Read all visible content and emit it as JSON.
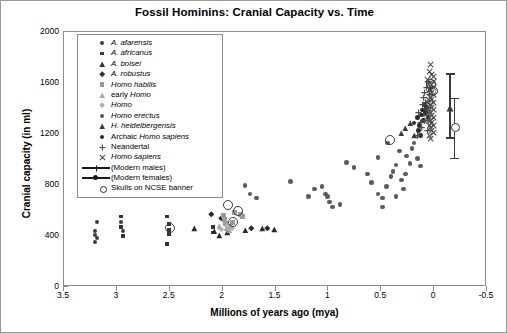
{
  "chart_data": {
    "type": "scatter",
    "title": "Fossil Hominins: Cranial Capacity vs. Time",
    "xlabel": "Millions of years ago (mya)",
    "ylabel": "Cranial capacity (in ml)",
    "xlim": [
      3.5,
      -0.5
    ],
    "ylim": [
      0,
      2000
    ],
    "x_reversed": true,
    "grid": false,
    "legend_position": "upper-left-inside",
    "xticks": [
      "3.5",
      "3",
      "2.5",
      "2",
      "1.5",
      "1",
      "0.5",
      "0",
      "-0.5"
    ],
    "xtick_values": [
      3.5,
      3,
      2.5,
      2,
      1.5,
      1,
      0.5,
      0,
      -0.5
    ],
    "yticks": [
      "0",
      "400",
      "800",
      "1200",
      "1600",
      "2000"
    ],
    "ytick_values": [
      0,
      400,
      800,
      1200,
      1600,
      2000
    ],
    "legend": [
      {
        "label": "A. afarensis",
        "italic": true,
        "marker": "circle",
        "color": "#3d3d3d",
        "size": 4
      },
      {
        "label": "A. africanus",
        "italic": true,
        "marker": "square",
        "color": "#3d3d3d",
        "size": 3.6
      },
      {
        "label": "A. boisei",
        "italic": true,
        "marker": "triangle",
        "color": "#2f2f2f",
        "size": 4.4
      },
      {
        "label": "A. robustus",
        "italic": true,
        "marker": "diamond",
        "color": "#2f2f2f",
        "size": 4.4
      },
      {
        "label": "Homo habilis",
        "italic": true,
        "marker": "square",
        "color": "#9a9a9a",
        "size": 4.6
      },
      {
        "label": "early Homo",
        "italic": false,
        "italic_part": "Homo",
        "marker": "triangle",
        "color": "#a8a8a8",
        "size": 4.4
      },
      {
        "label": "Homo",
        "italic": true,
        "marker": "diamond",
        "color": "#b0b0b0",
        "size": 4.2
      },
      {
        "label": "Homo erectus",
        "italic": true,
        "marker": "circle",
        "color": "#565656",
        "size": 4.4
      },
      {
        "label": "H. heidelbergensis",
        "italic": true,
        "marker": "triangle",
        "color": "#3a3a3a",
        "size": 4.4
      },
      {
        "label": "Archaic Homo sapiens",
        "italic": false,
        "italic_part": "Homo sapiens",
        "marker": "circle",
        "color": "#2b2b2b",
        "size": 4.4
      },
      {
        "label": "Neandertal",
        "italic": false,
        "marker": "plus",
        "color": "#4a4a4a",
        "size": 5
      },
      {
        "label": "Homo sapiens",
        "italic": true,
        "marker": "cross",
        "color": "#4a4a4a",
        "size": 5
      },
      {
        "label": "(Modern males)",
        "italic": false,
        "marker": "line-plus",
        "color": "#1a1a1a",
        "size": 5
      },
      {
        "label": "(Modern females)",
        "italic": false,
        "marker": "line-circle",
        "color": "#1a1a1a",
        "size": 5
      },
      {
        "label": "Skulls on NCSE banner",
        "italic": false,
        "marker": "open-circle",
        "color": "#2b2b2b",
        "size": 5
      }
    ],
    "series": [
      {
        "name": "A. afarensis",
        "marker": "circle",
        "color": "#3d3d3d",
        "size": 4.4,
        "points": [
          [
            3.18,
            500
          ],
          [
            3.2,
            430
          ],
          [
            3.2,
            400
          ],
          [
            3.18,
            375
          ],
          [
            3.2,
            345
          ],
          [
            2.95,
            500
          ],
          [
            2.93,
            430
          ]
        ]
      },
      {
        "name": "A. africanus",
        "marker": "square",
        "color": "#333333",
        "size": 3.8,
        "points": [
          [
            2.95,
            545
          ],
          [
            2.95,
            460
          ],
          [
            2.93,
            395
          ],
          [
            2.52,
            545
          ],
          [
            2.5,
            485
          ],
          [
            2.5,
            440
          ],
          [
            2.5,
            405
          ],
          [
            2.52,
            330
          ],
          [
            2.08,
            460
          ],
          [
            2.08,
            420
          ]
        ]
      },
      {
        "name": "A. boisei",
        "marker": "triangle",
        "color": "#2a2a2a",
        "size": 4.6,
        "points": [
          [
            2.26,
            450
          ],
          [
            2.07,
            430
          ],
          [
            2.02,
            395
          ],
          [
            1.78,
            440
          ],
          [
            1.62,
            450
          ],
          [
            1.5,
            445
          ],
          [
            1.95,
            420
          ]
        ]
      },
      {
        "name": "A. robustus",
        "marker": "diamond",
        "color": "#2a2a2a",
        "size": 4.6,
        "points": [
          [
            2.1,
            560
          ],
          [
            2.0,
            530
          ],
          [
            1.72,
            455
          ],
          [
            1.57,
            455
          ]
        ]
      },
      {
        "name": "Homo habilis",
        "marker": "square",
        "color": "#9c9c9c",
        "size": 5,
        "points": [
          [
            1.98,
            555
          ],
          [
            1.97,
            520
          ],
          [
            1.96,
            490
          ],
          [
            1.93,
            470
          ],
          [
            1.88,
            575
          ],
          [
            1.82,
            560
          ],
          [
            1.8,
            545
          ],
          [
            1.9,
            500
          ]
        ]
      },
      {
        "name": "early Homo",
        "marker": "triangle",
        "color": "#a5a5a5",
        "size": 4.6,
        "points": [
          [
            2.02,
            470
          ],
          [
            1.96,
            455
          ],
          [
            1.93,
            440
          ]
        ]
      },
      {
        "name": "Homo",
        "marker": "diamond",
        "color": "#b2b2b2",
        "size": 4.4,
        "points": [
          [
            1.95,
            470
          ],
          [
            1.9,
            455
          ],
          [
            2.0,
            445
          ]
        ]
      },
      {
        "name": "Homo erectus",
        "marker": "circle",
        "color": "#5a5a5a",
        "size": 4.6,
        "points": [
          [
            1.78,
            790
          ],
          [
            1.73,
            720
          ],
          [
            1.67,
            690
          ],
          [
            1.35,
            820
          ],
          [
            1.18,
            700
          ],
          [
            1.12,
            760
          ],
          [
            1.05,
            780
          ],
          [
            1.02,
            720
          ],
          [
            1.0,
            700
          ],
          [
            0.98,
            660
          ],
          [
            0.95,
            620
          ],
          [
            0.88,
            640
          ],
          [
            0.82,
            970
          ],
          [
            0.75,
            930
          ],
          [
            0.62,
            880
          ],
          [
            0.58,
            810
          ],
          [
            0.52,
            720
          ],
          [
            0.48,
            690
          ],
          [
            0.44,
            780
          ],
          [
            0.4,
            860
          ],
          [
            0.38,
            900
          ],
          [
            0.35,
            950
          ],
          [
            0.3,
            830
          ],
          [
            0.28,
            760
          ],
          [
            0.25,
            1020
          ],
          [
            0.22,
            960
          ],
          [
            0.2,
            1080
          ],
          [
            0.18,
            1120
          ],
          [
            0.15,
            1000
          ],
          [
            0.12,
            940
          ],
          [
            0.32,
            1060
          ],
          [
            0.26,
            880
          ],
          [
            0.35,
            700
          ],
          [
            0.48,
            620
          ],
          [
            0.52,
            1010
          ],
          [
            0.43,
            1120
          ]
        ]
      },
      {
        "name": "H. heidelbergensis",
        "marker": "triangle",
        "color": "#3a3a3a",
        "size": 4.6,
        "points": [
          [
            0.3,
            1200
          ],
          [
            0.26,
            1240
          ],
          [
            0.22,
            1280
          ],
          [
            0.18,
            1180
          ]
        ]
      },
      {
        "name": "Archaic Homo sapiens",
        "marker": "circle",
        "color": "#2b2b2b",
        "size": 4.6,
        "points": [
          [
            0.18,
            1280
          ],
          [
            0.15,
            1320
          ],
          [
            0.13,
            1260
          ],
          [
            0.11,
            1340
          ],
          [
            0.1,
            1380
          ],
          [
            0.09,
            1300
          ],
          [
            0.08,
            1420
          ],
          [
            0.07,
            1360
          ],
          [
            0.12,
            1180
          ],
          [
            0.14,
            1220
          ],
          [
            0.06,
            1400
          ],
          [
            0.05,
            1320
          ]
        ]
      },
      {
        "name": "Neandertal",
        "marker": "plus",
        "color": "#4a4a4a",
        "size": 5.2,
        "points": [
          [
            0.14,
            1360
          ],
          [
            0.1,
            1420
          ],
          [
            0.09,
            1480
          ],
          [
            0.08,
            1520
          ],
          [
            0.07,
            1440
          ],
          [
            0.06,
            1560
          ],
          [
            0.05,
            1400
          ],
          [
            0.12,
            1280
          ],
          [
            0.15,
            1180
          ],
          [
            0.11,
            1240
          ],
          [
            0.04,
            1600
          ],
          [
            0.06,
            1340
          ],
          [
            0.03,
            1500
          ],
          [
            0.05,
            1220
          ],
          [
            0.08,
            1300
          ]
        ]
      },
      {
        "name": "Homo sapiens",
        "marker": "cross",
        "color": "#4a4a4a",
        "size": 5.2,
        "points": [
          [
            0.02,
            1740
          ],
          [
            0.01,
            1660
          ],
          [
            0.0,
            1640
          ],
          [
            0.0,
            1600
          ],
          [
            0.01,
            1580
          ],
          [
            0.0,
            1560
          ],
          [
            0.02,
            1540
          ],
          [
            0.01,
            1520
          ],
          [
            0.0,
            1500
          ],
          [
            0.02,
            1480
          ],
          [
            0.01,
            1460
          ],
          [
            0.0,
            1440
          ],
          [
            0.02,
            1420
          ],
          [
            0.01,
            1400
          ],
          [
            0.0,
            1380
          ],
          [
            0.02,
            1360
          ],
          [
            0.01,
            1340
          ],
          [
            0.0,
            1320
          ],
          [
            0.02,
            1300
          ],
          [
            0.01,
            1280
          ],
          [
            0.0,
            1260
          ],
          [
            0.02,
            1240
          ],
          [
            0.01,
            1220
          ],
          [
            0.0,
            1200
          ],
          [
            0.03,
            1180
          ],
          [
            0.02,
            1160
          ],
          [
            0.04,
            1460
          ],
          [
            0.03,
            1380
          ],
          [
            0.04,
            1300
          ],
          [
            0.03,
            1540
          ],
          [
            0.05,
            1620
          ],
          [
            0.04,
            1580
          ],
          [
            0.03,
            1680
          ],
          [
            0.05,
            1440
          ],
          [
            0.04,
            1360
          ],
          [
            0.03,
            1260
          ]
        ]
      },
      {
        "name": "Skulls on NCSE banner",
        "marker": "open-circle",
        "color": "#3a3a3a",
        "size": 8,
        "points": [
          [
            2.5,
            460
          ],
          [
            1.9,
            510
          ],
          [
            1.85,
            600
          ],
          [
            1.95,
            645
          ],
          [
            0.42,
            1150
          ],
          [
            0.03,
            1590
          ],
          [
            0.01,
            1540
          ]
        ]
      }
    ],
    "error_bars": [
      {
        "name": "Modern males",
        "x": -0.16,
        "center": 1400,
        "low": 1160,
        "high": 1660,
        "marker": "triangle",
        "color": "#3a3a3a"
      },
      {
        "name": "Modern females",
        "x": -0.2,
        "center": 1250,
        "low": 1000,
        "high": 1470,
        "marker": "open-circle",
        "color": "#3a3a3a"
      }
    ]
  }
}
